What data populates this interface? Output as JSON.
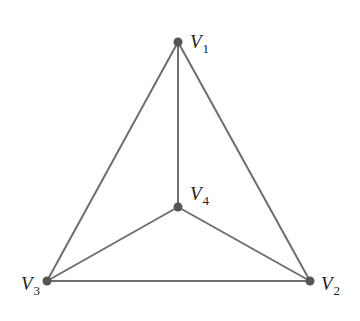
{
  "diagram": {
    "type": "graph",
    "colors": {
      "edge": "#6e6e6e",
      "vertex": "#555555",
      "label": "#222222",
      "background": "#ffffff"
    },
    "vertices": [
      {
        "id": "V1",
        "letter": "V",
        "subscript": "1",
        "x": 178,
        "y": 42,
        "label_x": 190,
        "label_y": 48
      },
      {
        "id": "V2",
        "letter": "V",
        "subscript": "2",
        "x": 310,
        "y": 281,
        "label_x": 321,
        "label_y": 290
      },
      {
        "id": "V3",
        "letter": "V",
        "subscript": "3",
        "x": 47,
        "y": 281,
        "label_x": 21,
        "label_y": 290
      },
      {
        "id": "V4",
        "letter": "V",
        "subscript": "4",
        "x": 178,
        "y": 207,
        "label_x": 190,
        "label_y": 200
      }
    ],
    "edges": [
      {
        "from": "V1",
        "to": "V2"
      },
      {
        "from": "V1",
        "to": "V3"
      },
      {
        "from": "V1",
        "to": "V4"
      },
      {
        "from": "V2",
        "to": "V3"
      },
      {
        "from": "V2",
        "to": "V4"
      },
      {
        "from": "V3",
        "to": "V4"
      }
    ]
  }
}
